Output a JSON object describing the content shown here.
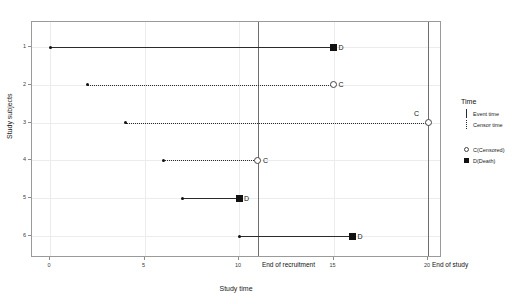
{
  "chart_data": {
    "type": "scatter",
    "title": "",
    "xlabel": "Study time",
    "ylabel": "Study subjects",
    "xlim": [
      -1,
      21.5
    ],
    "ylim": [
      0.4,
      6.6
    ],
    "xticks": [
      0,
      5,
      10,
      15,
      20
    ],
    "xticklabels": [
      "0",
      "5",
      "10",
      "15",
      "20"
    ],
    "yticks": [
      1,
      2,
      3,
      4,
      5,
      6
    ],
    "yticklabels": [
      "1",
      "2",
      "3",
      "4",
      "5",
      "6"
    ],
    "grid": true,
    "legend_position": "right",
    "subjects": [
      {
        "id": 1,
        "start": 0,
        "end": 15,
        "status": "D",
        "line": "Event time",
        "marker": "square",
        "label": "D"
      },
      {
        "id": 2,
        "start": 2,
        "end": 15,
        "status": "C",
        "line": "Censor time",
        "marker": "circle",
        "label": "C"
      },
      {
        "id": 3,
        "start": 4,
        "end": 20,
        "status": "C",
        "line": "Censor time",
        "marker": "circle",
        "label": "C"
      },
      {
        "id": 4,
        "start": 6,
        "end": 11,
        "status": "C",
        "line": "Censor time",
        "marker": "circle",
        "label": "C"
      },
      {
        "id": 5,
        "start": 7,
        "end": 10,
        "status": "D",
        "line": "Event time",
        "marker": "square",
        "label": "D"
      },
      {
        "id": 6,
        "start": 10,
        "end": 16,
        "status": "D",
        "line": "Event time",
        "marker": "square",
        "label": "D"
      }
    ],
    "reference_lines": [
      {
        "x": 11,
        "label": "End of recruitment"
      },
      {
        "x": 20,
        "label": "End of study"
      }
    ],
    "legend": {
      "title": "Time",
      "line_entries": [
        {
          "label": "Event time",
          "style": "solid"
        },
        {
          "label": "Censor time",
          "style": "dotted"
        }
      ],
      "marker_entries": [
        {
          "label": "C(Censored)",
          "marker": "circle"
        },
        {
          "label": "D(Death)",
          "marker": "square"
        }
      ]
    },
    "colors": {
      "line": "#2b2b2b",
      "marker": "#111111",
      "grid": "#ececec",
      "panel_border": "#9a9a9a",
      "reference_line": "#6e6e6e",
      "background": "#ffffff"
    }
  }
}
